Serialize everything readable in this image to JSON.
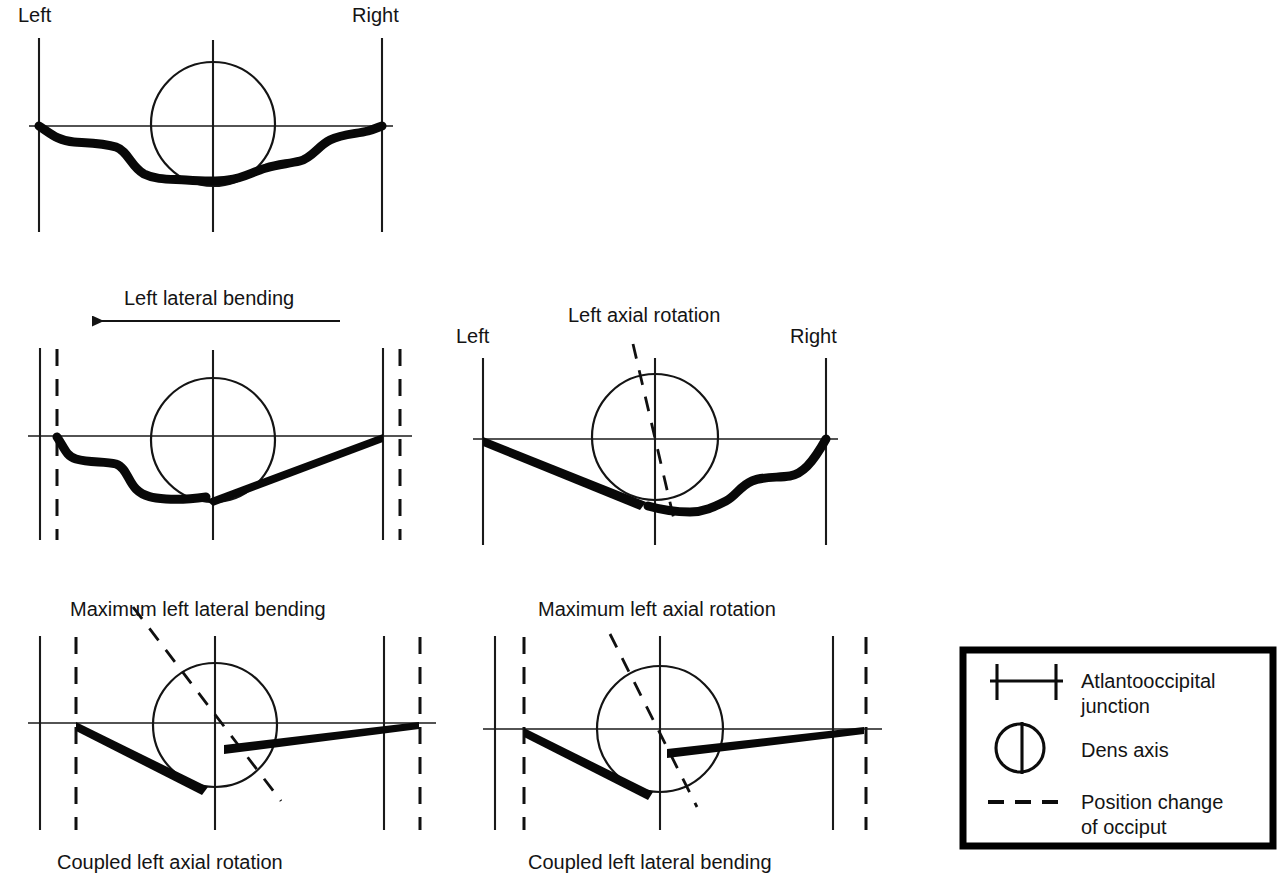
{
  "figure": {
    "background": "#ffffff",
    "ink_color": "#111111"
  },
  "panels": [
    {
      "id": "neutral",
      "row": 1,
      "top_left_label": "Left",
      "top_right_label": "Right",
      "motion_label": "",
      "caption": "",
      "has_dashed_verticals": false,
      "has_rotation_dashed_line": false,
      "occiput_style": "wavy-both-sides"
    },
    {
      "id": "left-lateral-bending",
      "row": 2,
      "top_left_label": "",
      "top_right_label": "",
      "motion_label": "Left lateral bending",
      "caption": "",
      "arrow_direction": "left",
      "has_dashed_verticals": true,
      "has_rotation_dashed_line": false,
      "occiput_style": "wavy-left-wedge-right"
    },
    {
      "id": "left-axial-rotation",
      "row": 2,
      "top_left_label": "Left",
      "top_right_label": "Right",
      "motion_label": "Left axial rotation",
      "caption": "",
      "has_dashed_verticals": false,
      "has_rotation_dashed_line": true,
      "rotation_tilt_degrees": 10,
      "occiput_style": "wedge-left-wavy-right"
    },
    {
      "id": "max-left-lateral-bending",
      "row": 3,
      "top_left_label": "",
      "top_right_label": "",
      "motion_label": "Maximum left lateral bending",
      "caption": "Coupled left axial rotation",
      "has_dashed_verticals": true,
      "has_rotation_dashed_line": true,
      "rotation_tilt_degrees": 36,
      "occiput_style": "wedge-both-sides"
    },
    {
      "id": "max-left-axial-rotation",
      "row": 3,
      "top_left_label": "",
      "top_right_label": "",
      "motion_label": "Maximum left axial rotation",
      "caption": "Coupled left lateral bending",
      "has_dashed_verticals": true,
      "has_rotation_dashed_line": true,
      "rotation_tilt_degrees": 20,
      "occiput_style": "wedge-both-sides"
    }
  ],
  "legend": {
    "items": [
      {
        "symbol": "atlantooccipital-junction-symbol",
        "label_line1": "Atlantooccipital",
        "label_line2": "junction"
      },
      {
        "symbol": "dens-axis-symbol",
        "label_line1": "Dens axis",
        "label_line2": ""
      },
      {
        "symbol": "position-change-dashed-symbol",
        "label_line1": "Position change",
        "label_line2": "of occiput"
      }
    ]
  },
  "labels": {
    "left": "Left",
    "right": "Right",
    "left_lateral_bending": "Left lateral bending",
    "left_axial_rotation": "Left axial rotation",
    "maximum_left_lateral_bending": "Maximum left lateral bending",
    "maximum_left_axial_rotation": "Maximum left axial rotation",
    "coupled_left_axial_rotation": "Coupled left axial rotation",
    "coupled_left_lateral_bending": "Coupled left lateral bending"
  }
}
